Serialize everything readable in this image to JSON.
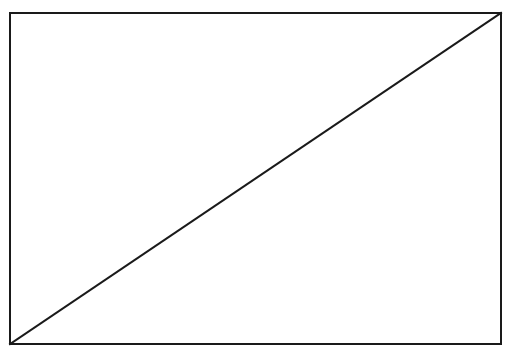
{
  "figure": {
    "type": "line-drawing",
    "canvas": {
      "width": 507,
      "height": 353,
      "background_color": "#ffffff"
    },
    "stroke": {
      "color": "#1a1a1a",
      "width": 2,
      "linecap": "square",
      "linejoin": "miter"
    },
    "shapes": [
      {
        "name": "outer-rectangle",
        "kind": "rect",
        "x": 10,
        "y": 13,
        "width": 491,
        "height": 331,
        "fill": "none",
        "stroke_color": "#1a1a1a",
        "stroke_width": 2
      },
      {
        "name": "diagonal-line",
        "kind": "line",
        "x1": 10,
        "y1": 344,
        "x2": 501,
        "y2": 13,
        "direction": "bottom-left-to-top-right",
        "stroke_color": "#1a1a1a",
        "stroke_width": 2
      }
    ],
    "labels": [],
    "annotations": []
  }
}
